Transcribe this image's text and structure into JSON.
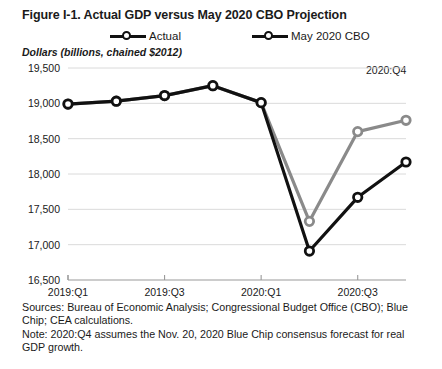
{
  "figure": {
    "title": "Figure I-1. Actual GDP versus May 2020 CBO Projection",
    "axis_note": "Dollars (billions, chained $2012)",
    "annotation": "2020:Q4"
  },
  "legend": {
    "items": [
      {
        "label": "Actual",
        "color": "#8a8a8a",
        "marker": "circle-open"
      },
      {
        "label": "May 2020 CBO",
        "color": "#111111",
        "marker": "circle-open"
      }
    ]
  },
  "footnotes": {
    "sources": "Sources: Bureau of Economic Analysis; Congressional Budget Office (CBO); Blue Chip; CEA calculations.",
    "note": "Note: 2020:Q4 assumes the Nov. 20, 2020 Blue Chip consensus forecast for real GDP growth."
  },
  "chart_data": {
    "type": "line",
    "title": "Figure I-1. Actual GDP versus May 2020 CBO Projection",
    "xlabel": "",
    "ylabel": "Dollars (billions, chained $2012)",
    "ylim": [
      16500,
      19500
    ],
    "ytick_values": [
      16500,
      17000,
      17500,
      18000,
      18500,
      19000,
      19500
    ],
    "ytick_labels": [
      "16,500",
      "17,000",
      "17,500",
      "18,000",
      "18,500",
      "19,000",
      "19,500"
    ],
    "grid": true,
    "legend_position": "top",
    "x": [
      "2019:Q1",
      "2019:Q2",
      "2019:Q3",
      "2019:Q4",
      "2020:Q1",
      "2020:Q2",
      "2020:Q3",
      "2020:Q4"
    ],
    "xtick_labels": [
      "2019:Q1",
      "2019:Q3",
      "2020:Q1",
      "2020:Q3"
    ],
    "xtick_indices": [
      0,
      2,
      4,
      6
    ],
    "series": [
      {
        "name": "Actual",
        "color": "#8a8a8a",
        "values": [
          18990,
          19030,
          19110,
          19250,
          19010,
          17330,
          18600,
          18760
        ]
      },
      {
        "name": "May 2020 CBO",
        "color": "#111111",
        "values": [
          18990,
          19030,
          19110,
          19250,
          19010,
          16910,
          17670,
          18170
        ]
      }
    ],
    "annotations": [
      {
        "text": "2020:Q4",
        "x": "2020:Q4",
        "y": 19430
      }
    ]
  }
}
